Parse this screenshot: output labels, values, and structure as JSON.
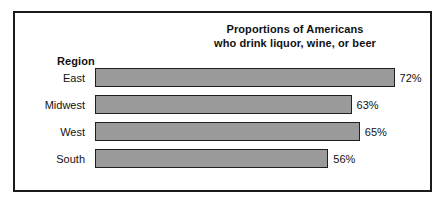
{
  "figure": {
    "region_header": "Region",
    "title_lines": [
      "Proportions of Americans",
      "who drink liquor, wine, or beer"
    ],
    "colors": {
      "bar_fill": "#9a9a9a",
      "bar_outline": "#1f1f1f",
      "frame": "#1b1b1b",
      "background": "#ffffff",
      "text": "#111111"
    }
  },
  "chart_data": {
    "type": "bar",
    "orientation": "horizontal",
    "title": "Proportions of Americans who drink liquor, wine, or beer",
    "xlabel": "",
    "ylabel": "Region",
    "categories": [
      "East",
      "Midwest",
      "West",
      "South"
    ],
    "values": [
      72,
      63,
      65,
      56
    ],
    "value_labels": [
      "72%",
      "63%",
      "65%",
      "56%"
    ],
    "units": "percent",
    "xlim": [
      0,
      100
    ],
    "grid": false,
    "legend": false,
    "bars": [
      {
        "category": "East",
        "value": 72,
        "label": "72%",
        "width_pct": 90.5
      },
      {
        "category": "Midwest",
        "value": 63,
        "label": "63%",
        "width_pct": 77.5
      },
      {
        "category": "West",
        "value": 65,
        "label": "65%",
        "width_pct": 80.0
      },
      {
        "category": "South",
        "value": 56,
        "label": "56%",
        "width_pct": 70.5
      }
    ]
  }
}
